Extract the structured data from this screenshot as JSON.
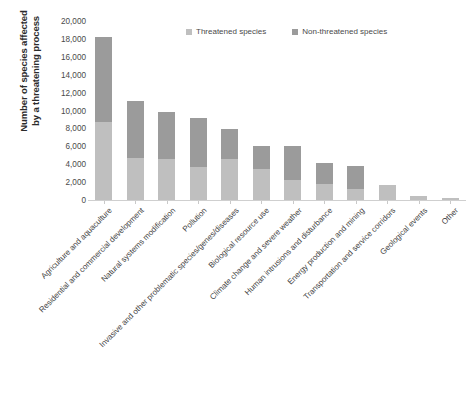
{
  "chart_data": {
    "type": "bar",
    "subtype": "stacked-vertical",
    "title": "",
    "xlabel": "",
    "ylabel": "Number of species affected by a threatening process",
    "ylabel_lines": [
      "Number of species affected",
      "by a threatening process"
    ],
    "ylim": [
      0,
      20000
    ],
    "y_tick_step": 2000,
    "y_ticks": [
      0,
      2000,
      4000,
      6000,
      8000,
      10000,
      12000,
      14000,
      16000,
      18000,
      20000
    ],
    "y_tick_labels": [
      "0",
      "2,000",
      "4,000",
      "6,000",
      "8,000",
      "10,000",
      "12,000",
      "14,000",
      "16,000",
      "18,000",
      "20,000"
    ],
    "grid": false,
    "legend_position": "top-right",
    "categories": [
      "Agriculture and aquaculture",
      "Residential and commercial development",
      "Natural systems modification",
      "Pollution",
      "Invasive and other problematic species/genes/diseases",
      "Biological resource use",
      "Climate change and severe weather",
      "Human intrusions and disturbance",
      "Energy production and mining",
      "Transportation and service corridors",
      "Geological events",
      "Other"
    ],
    "series": [
      {
        "name": "Threatened species",
        "color": "#bfbfbf",
        "values": [
          8800,
          4800,
          4700,
          3800,
          4700,
          3600,
          2400,
          1900,
          1300,
          1750,
          550,
          300
        ]
      },
      {
        "name": "Non-threatened species",
        "color": "#9b9b9b",
        "values": [
          9500,
          6400,
          5300,
          5500,
          3300,
          2600,
          3700,
          2300,
          2600,
          50,
          0,
          0
        ]
      }
    ],
    "totals": [
      18300,
      11200,
      10000,
      9300,
      8000,
      6200,
      6100,
      4200,
      3900,
      1800,
      550,
      300
    ]
  },
  "legend": {
    "items": [
      {
        "label": "Threatened species",
        "color": "#bfbfbf"
      },
      {
        "label": "Non-threatened species",
        "color": "#9b9b9b"
      }
    ]
  }
}
